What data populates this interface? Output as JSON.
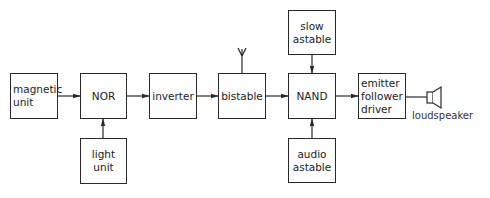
{
  "diagram": {
    "blocks": [
      {
        "id": "magnetic-unit",
        "label": "magnetic\nunit"
      },
      {
        "id": "nor",
        "label": "NOR"
      },
      {
        "id": "light-unit",
        "label": "light\nunit"
      },
      {
        "id": "inverter",
        "label": "inverter"
      },
      {
        "id": "bistable",
        "label": "bistable"
      },
      {
        "id": "slow-astable",
        "label": "slow\nastable"
      },
      {
        "id": "nand",
        "label": "NAND"
      },
      {
        "id": "audio-astable",
        "label": "audio\nastable"
      },
      {
        "id": "emitter-follower-driver",
        "label": "emitter\nfollower\ndriver"
      }
    ],
    "output_device": {
      "label": "loudspeaker",
      "icon": "speaker-icon"
    },
    "antenna": {
      "icon": "antenna-icon",
      "attached_to": "bistable"
    },
    "connections": [
      {
        "from": "magnetic-unit",
        "to": "nor"
      },
      {
        "from": "light-unit",
        "to": "nor"
      },
      {
        "from": "nor",
        "to": "inverter"
      },
      {
        "from": "inverter",
        "to": "bistable"
      },
      {
        "from": "bistable",
        "to": "nand"
      },
      {
        "from": "slow-astable",
        "to": "nand"
      },
      {
        "from": "audio-astable",
        "to": "nand"
      },
      {
        "from": "nand",
        "to": "emitter-follower-driver"
      },
      {
        "from": "emitter-follower-driver",
        "to": "loudspeaker"
      }
    ]
  }
}
